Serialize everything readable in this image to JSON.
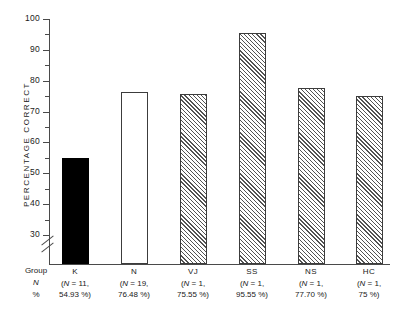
{
  "chart_data": {
    "type": "bar",
    "title": "",
    "xlabel": "",
    "ylabel": "PERCENTAGE CORRECT",
    "ylim": [
      25,
      100
    ],
    "axis_break": true,
    "axis_break_below": 30,
    "grid": false,
    "legend": null,
    "categories": [
      "K",
      "N",
      "VJ",
      "SS",
      "NS",
      "HC"
    ],
    "values": [
      54.93,
      76.48,
      75.55,
      95.55,
      77.7,
      75
    ],
    "yticks_major": [
      100,
      90,
      80,
      70,
      60,
      50,
      40,
      30
    ],
    "ytick_labels": [
      "100",
      "90",
      "80",
      "70",
      "60",
      "50",
      "40",
      "30"
    ],
    "yticks_minor": [
      95,
      85,
      75,
      65,
      55,
      45,
      35
    ],
    "bar_styles": [
      "solid",
      "open",
      "hatch",
      "hatch",
      "hatch",
      "hatch"
    ],
    "series": [
      {
        "name": "Percentage correct",
        "values": [
          54.93,
          76.48,
          75.55,
          95.55,
          77.7,
          75
        ]
      }
    ],
    "n_values": [
      11,
      19,
      1,
      1,
      1,
      1
    ]
  },
  "axis": {
    "ylabel": "PERCENTAGE CORRECT",
    "ticks": [
      {
        "label": "100",
        "value": 100
      },
      {
        "label": "90",
        "value": 90
      },
      {
        "label": "80",
        "value": 80
      },
      {
        "label": "70",
        "value": 70
      },
      {
        "label": "60",
        "value": 60
      },
      {
        "label": "50",
        "value": 50
      },
      {
        "label": "40",
        "value": 40
      },
      {
        "label": "30",
        "value": 30
      }
    ]
  },
  "table": {
    "row_labels": {
      "group": "Group",
      "n": "N",
      "percent": "%"
    },
    "columns": [
      {
        "group": "K",
        "n": "(N = 11,",
        "percent": "54.93 %)"
      },
      {
        "group": "N",
        "n": "(N = 19,",
        "percent": "76.48 %)"
      },
      {
        "group": "VJ",
        "n": "(N = 1,",
        "percent": "75.55 %)"
      },
      {
        "group": "SS",
        "n": "(N = 1,",
        "percent": "95.55 %)"
      },
      {
        "group": "NS",
        "n": "(N = 1,",
        "percent": "77.70 %)"
      },
      {
        "group": "HC",
        "n": "(N = 1,",
        "percent": "75 %)"
      }
    ]
  },
  "colors": {
    "axis": "#4a4a4a",
    "bar_outline": "#3c3c3c",
    "bar_solid": "#000000",
    "hatch": "#535353",
    "background": "#ffffff"
  }
}
